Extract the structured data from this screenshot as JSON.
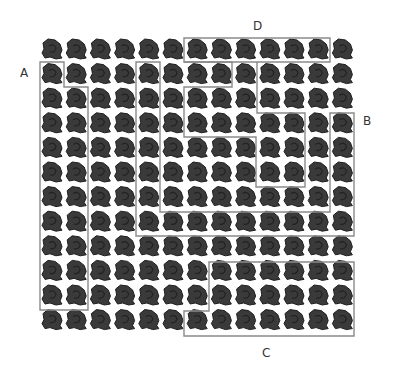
{
  "figure": {
    "grid": {
      "columns": 13,
      "rows": 12
    },
    "tile": {
      "name": "rock-tile",
      "color": "#3a3a3a",
      "outline_color": "#1e1e1e"
    },
    "outline_color": "#8a8a8a",
    "regions": [
      {
        "label": "A",
        "cells": "column 0 rows 1-10 plus column 1 rows 2-10"
      },
      {
        "label": "B",
        "cells": "U-shaped band: column 4 rows 1-7, row 7 columns 4-12, column 12 rows 3-7"
      },
      {
        "label": "C",
        "cells": "rows 9-11 columns 7-12 plus row 11 column 6"
      },
      {
        "label": "D",
        "cells": "row 0 columns 6-11"
      }
    ],
    "labels": {
      "A": "A",
      "B": "B",
      "C": "C",
      "D": "D"
    }
  }
}
